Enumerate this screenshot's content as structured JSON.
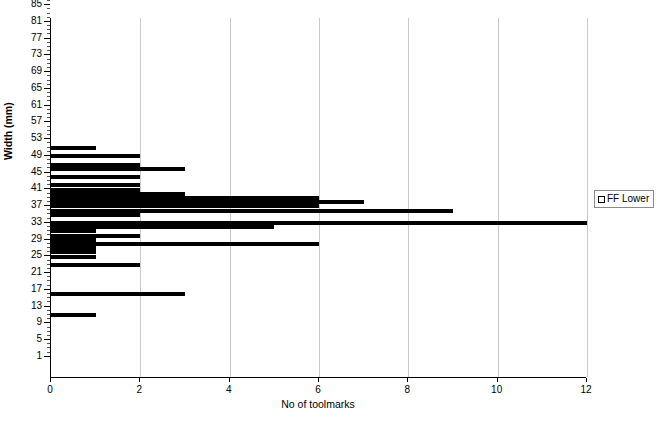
{
  "chart_data": {
    "type": "bar",
    "orientation": "horizontal",
    "title": "",
    "xlabel": "No of toolmarks",
    "ylabel": "Width (mm)",
    "xlim": [
      0,
      12
    ],
    "ylim": [
      0,
      86
    ],
    "xticks": [
      0,
      2,
      4,
      6,
      8,
      10,
      12
    ],
    "yticks": [
      1,
      5,
      9,
      13,
      17,
      21,
      25,
      29,
      33,
      37,
      41,
      45,
      49,
      53,
      57,
      61,
      65,
      69,
      73,
      77,
      81,
      85
    ],
    "y_minor_tick_step": 1,
    "grid": "vertical",
    "legend": {
      "entries": [
        "FF Lower"
      ],
      "position": "right",
      "marker": "open-square"
    },
    "bar_color": "#000000",
    "categories": [
      55,
      54,
      53,
      52,
      51,
      50,
      49,
      48,
      47,
      46,
      45,
      44,
      43,
      42,
      41,
      40,
      39,
      38,
      37,
      36,
      35,
      34,
      33,
      32,
      31,
      30,
      29,
      28,
      27,
      26,
      25,
      20,
      15
    ],
    "values": [
      1,
      0,
      2,
      0,
      2,
      3,
      0,
      2,
      0,
      2,
      2,
      3,
      6,
      7,
      6,
      9,
      2,
      0,
      12,
      5,
      1,
      2,
      1,
      6,
      1,
      1,
      1,
      0,
      2,
      0,
      0,
      3,
      1
    ],
    "series": [
      {
        "name": "FF Lower",
        "points": [
          {
            "width_mm": 55,
            "no_of_toolmarks": 1
          },
          {
            "width_mm": 53,
            "no_of_toolmarks": 2
          },
          {
            "width_mm": 51,
            "no_of_toolmarks": 2
          },
          {
            "width_mm": 50,
            "no_of_toolmarks": 3
          },
          {
            "width_mm": 48,
            "no_of_toolmarks": 2
          },
          {
            "width_mm": 46,
            "no_of_toolmarks": 2
          },
          {
            "width_mm": 45,
            "no_of_toolmarks": 2
          },
          {
            "width_mm": 44,
            "no_of_toolmarks": 3
          },
          {
            "width_mm": 43,
            "no_of_toolmarks": 6
          },
          {
            "width_mm": 42,
            "no_of_toolmarks": 7
          },
          {
            "width_mm": 41,
            "no_of_toolmarks": 6
          },
          {
            "width_mm": 40,
            "no_of_toolmarks": 9
          },
          {
            "width_mm": 39,
            "no_of_toolmarks": 2
          },
          {
            "width_mm": 37,
            "no_of_toolmarks": 12
          },
          {
            "width_mm": 36,
            "no_of_toolmarks": 5
          },
          {
            "width_mm": 35,
            "no_of_toolmarks": 1
          },
          {
            "width_mm": 34,
            "no_of_toolmarks": 2
          },
          {
            "width_mm": 33,
            "no_of_toolmarks": 1
          },
          {
            "width_mm": 32,
            "no_of_toolmarks": 6
          },
          {
            "width_mm": 31,
            "no_of_toolmarks": 1
          },
          {
            "width_mm": 30,
            "no_of_toolmarks": 1
          },
          {
            "width_mm": 29,
            "no_of_toolmarks": 1
          },
          {
            "width_mm": 27,
            "no_of_toolmarks": 2
          },
          {
            "width_mm": 20,
            "no_of_toolmarks": 3
          },
          {
            "width_mm": 15,
            "no_of_toolmarks": 1
          }
        ]
      }
    ]
  }
}
